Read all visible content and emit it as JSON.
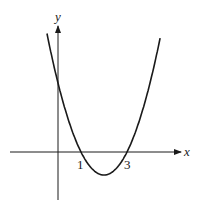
{
  "chart_data": {
    "type": "line",
    "title": "",
    "xlabel": "x",
    "ylabel": "y",
    "function": "y = (x - 1)(x - 3)",
    "series": [
      {
        "name": "parabola",
        "x": [
          -0.5,
          0,
          0.5,
          1,
          1.5,
          2,
          2.5,
          3,
          3.5,
          4,
          4.5
        ],
        "values": [
          5.25,
          3,
          1.25,
          0,
          -0.75,
          -1,
          -0.75,
          0,
          1.25,
          3,
          5.25
        ]
      }
    ],
    "x_ticks_labeled": [
      "1",
      "3"
    ],
    "x_intercepts": [
      1,
      3
    ],
    "vertex": [
      2,
      -1
    ],
    "y_intercept": 3,
    "xlim": [
      -2,
      5.3
    ],
    "ylim": [
      -2,
      5.4
    ],
    "grid": false,
    "legend": "none"
  },
  "labels": {
    "x_axis": "x",
    "y_axis": "y",
    "tick_1": "1",
    "tick_3": "3"
  }
}
